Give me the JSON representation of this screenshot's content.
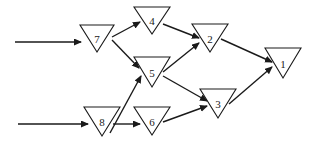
{
  "diagram": {
    "type": "directed-network",
    "node_shape": "inverted-triangle",
    "colors": {
      "stroke": "#1a1a1a",
      "fill": "#ffffff",
      "background": "#ffffff"
    },
    "nodes": [
      {
        "id": "1",
        "label": "1",
        "x": 283,
        "top": 48,
        "halfw": 18,
        "apex": 78
      },
      {
        "id": "2",
        "label": "2",
        "x": 210,
        "top": 24,
        "halfw": 18,
        "apex": 52
      },
      {
        "id": "3",
        "label": "3",
        "x": 218,
        "top": 89,
        "halfw": 18,
        "apex": 118
      },
      {
        "id": "4",
        "label": "4",
        "x": 152,
        "top": 7,
        "halfw": 18,
        "apex": 34
      },
      {
        "id": "5",
        "label": "5",
        "x": 152,
        "top": 57,
        "halfw": 18,
        "apex": 87
      },
      {
        "id": "6",
        "label": "6",
        "x": 152,
        "top": 107,
        "halfw": 18,
        "apex": 135
      },
      {
        "id": "7",
        "label": "7",
        "x": 97,
        "top": 25,
        "halfw": 17,
        "apex": 52
      },
      {
        "id": "8",
        "label": "8",
        "x": 102,
        "top": 107,
        "halfw": 18,
        "apex": 136
      }
    ],
    "inputs": [
      {
        "to": "7",
        "x1": 15,
        "y1": 42,
        "x2": 81,
        "y2": 42
      },
      {
        "to": "8",
        "x1": 18,
        "y1": 124,
        "x2": 88,
        "y2": 124
      }
    ],
    "edges": [
      {
        "from": "7",
        "to": "4",
        "x1": 112,
        "y1": 37,
        "x2": 140,
        "y2": 22
      },
      {
        "from": "7",
        "to": "5",
        "x1": 112,
        "y1": 40,
        "x2": 139,
        "y2": 68
      },
      {
        "from": "4",
        "to": "2",
        "x1": 163,
        "y1": 24,
        "x2": 199,
        "y2": 38
      },
      {
        "from": "5",
        "to": "2",
        "x1": 163,
        "y1": 72,
        "x2": 199,
        "y2": 43
      },
      {
        "from": "5",
        "to": "3",
        "x1": 163,
        "y1": 76,
        "x2": 207,
        "y2": 101
      },
      {
        "from": "2",
        "to": "1",
        "x1": 221,
        "y1": 39,
        "x2": 272,
        "y2": 62
      },
      {
        "from": "3",
        "to": "1",
        "x1": 229,
        "y1": 104,
        "x2": 272,
        "y2": 67
      },
      {
        "from": "8",
        "to": "5",
        "x1": 110,
        "y1": 133,
        "x2": 141,
        "y2": 76
      },
      {
        "from": "8",
        "to": "6",
        "x1": 113,
        "y1": 124,
        "x2": 140,
        "y2": 124
      },
      {
        "from": "6",
        "to": "3",
        "x1": 163,
        "y1": 122,
        "x2": 207,
        "y2": 106
      }
    ]
  }
}
